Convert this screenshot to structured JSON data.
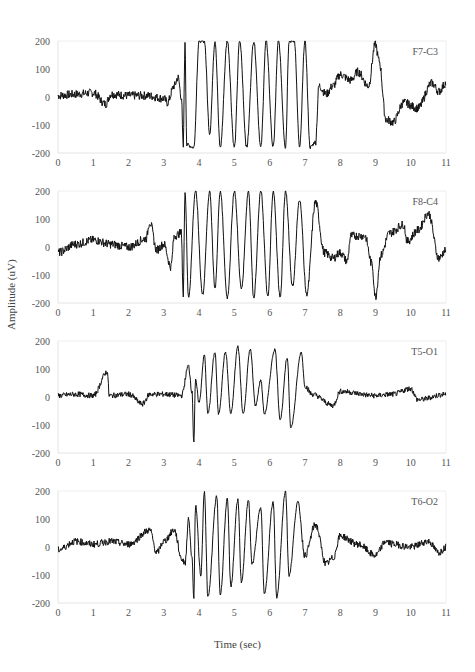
{
  "chart_data": {
    "type": "line",
    "title": "",
    "xlabel": "Time (sec)",
    "ylabel": "Amplitude (uV)",
    "xlim": [
      0,
      11
    ],
    "ylim": [
      -200,
      200
    ],
    "x_ticks": [
      "0",
      "1",
      "2",
      "3",
      "4",
      "5",
      "6",
      "7",
      "8",
      "9",
      "10",
      "11"
    ],
    "y_ticks": [
      "200",
      "100",
      "0",
      "-100",
      "-200"
    ],
    "grid": false,
    "line_color": "#111111",
    "panels": [
      {
        "channel": "F7-C3",
        "keypoints": [
          [
            0,
            5
          ],
          [
            0.5,
            10
          ],
          [
            1.0,
            15
          ],
          [
            1.35,
            -25
          ],
          [
            1.5,
            10
          ],
          [
            2.0,
            5
          ],
          [
            2.5,
            5
          ],
          [
            3.0,
            -5
          ],
          [
            3.1,
            -20
          ],
          [
            3.3,
            40
          ],
          [
            3.4,
            70
          ],
          [
            3.5,
            0
          ],
          [
            3.55,
            -180
          ],
          [
            3.6,
            190
          ],
          [
            3.65,
            -170
          ],
          [
            3.85,
            -180
          ],
          [
            4.0,
            200
          ],
          [
            4.15,
            200
          ],
          [
            4.3,
            -130
          ],
          [
            4.45,
            200
          ],
          [
            4.6,
            -180
          ],
          [
            4.8,
            200
          ],
          [
            5.0,
            -180
          ],
          [
            5.15,
            200
          ],
          [
            5.35,
            -180
          ],
          [
            5.55,
            200
          ],
          [
            5.75,
            -180
          ],
          [
            5.9,
            200
          ],
          [
            6.1,
            -180
          ],
          [
            6.25,
            200
          ],
          [
            6.45,
            -180
          ],
          [
            6.55,
            200
          ],
          [
            6.7,
            200
          ],
          [
            6.85,
            -180
          ],
          [
            7.0,
            200
          ],
          [
            7.15,
            -180
          ],
          [
            7.3,
            -160
          ],
          [
            7.4,
            40
          ],
          [
            7.6,
            10
          ],
          [
            7.8,
            40
          ],
          [
            8.0,
            80
          ],
          [
            8.3,
            60
          ],
          [
            8.5,
            90
          ],
          [
            8.8,
            40
          ],
          [
            9.0,
            190
          ],
          [
            9.1,
            130
          ],
          [
            9.3,
            -80
          ],
          [
            9.5,
            -90
          ],
          [
            9.8,
            -20
          ],
          [
            10.2,
            -40
          ],
          [
            10.6,
            50
          ],
          [
            10.8,
            20
          ],
          [
            11.0,
            50
          ]
        ],
        "burst": [
          3.55,
          7.3
        ],
        "noise": 22
      },
      {
        "channel": "F8-C4",
        "keypoints": [
          [
            0,
            -20
          ],
          [
            0.5,
            10
          ],
          [
            1.0,
            25
          ],
          [
            1.5,
            10
          ],
          [
            2.0,
            0
          ],
          [
            2.5,
            30
          ],
          [
            2.6,
            90
          ],
          [
            2.8,
            -10
          ],
          [
            3.0,
            10
          ],
          [
            3.2,
            -70
          ],
          [
            3.3,
            40
          ],
          [
            3.5,
            50
          ],
          [
            3.55,
            -180
          ],
          [
            3.6,
            200
          ],
          [
            3.7,
            -180
          ],
          [
            3.9,
            200
          ],
          [
            4.1,
            -170
          ],
          [
            4.3,
            200
          ],
          [
            4.45,
            -150
          ],
          [
            4.6,
            200
          ],
          [
            4.8,
            -180
          ],
          [
            5.0,
            200
          ],
          [
            5.2,
            -150
          ],
          [
            5.4,
            200
          ],
          [
            5.55,
            -180
          ],
          [
            5.75,
            200
          ],
          [
            5.95,
            -180
          ],
          [
            6.1,
            200
          ],
          [
            6.3,
            -180
          ],
          [
            6.45,
            200
          ],
          [
            6.65,
            -140
          ],
          [
            6.85,
            170
          ],
          [
            7.05,
            -170
          ],
          [
            7.3,
            160
          ],
          [
            7.55,
            -20
          ],
          [
            7.8,
            -40
          ],
          [
            8.0,
            -20
          ],
          [
            8.2,
            -50
          ],
          [
            8.3,
            40
          ],
          [
            8.7,
            40
          ],
          [
            8.9,
            -60
          ],
          [
            9.0,
            -180
          ],
          [
            9.15,
            -30
          ],
          [
            9.4,
            50
          ],
          [
            9.8,
            80
          ],
          [
            9.9,
            20
          ],
          [
            10.2,
            60
          ],
          [
            10.5,
            120
          ],
          [
            10.8,
            -40
          ],
          [
            11.0,
            -10
          ]
        ],
        "burst": [
          3.55,
          7.1
        ],
        "noise": 22
      },
      {
        "channel": "T5-O1",
        "keypoints": [
          [
            0,
            5
          ],
          [
            0.5,
            10
          ],
          [
            1.0,
            5
          ],
          [
            1.4,
            90
          ],
          [
            1.45,
            5
          ],
          [
            2.0,
            10
          ],
          [
            2.4,
            -25
          ],
          [
            2.6,
            10
          ],
          [
            3.0,
            10
          ],
          [
            3.5,
            5
          ],
          [
            3.7,
            110
          ],
          [
            3.8,
            20
          ],
          [
            3.85,
            -160
          ],
          [
            3.9,
            60
          ],
          [
            4.0,
            -20
          ],
          [
            4.15,
            150
          ],
          [
            4.25,
            -60
          ],
          [
            4.45,
            160
          ],
          [
            4.55,
            -60
          ],
          [
            4.75,
            160
          ],
          [
            4.9,
            -60
          ],
          [
            5.1,
            180
          ],
          [
            5.25,
            -60
          ],
          [
            5.45,
            170
          ],
          [
            5.6,
            -30
          ],
          [
            5.75,
            60
          ],
          [
            5.85,
            -60
          ],
          [
            6.15,
            170
          ],
          [
            6.3,
            -80
          ],
          [
            6.5,
            140
          ],
          [
            6.6,
            -110
          ],
          [
            6.9,
            160
          ],
          [
            7.0,
            40
          ],
          [
            7.2,
            10
          ],
          [
            7.8,
            -30
          ],
          [
            8.0,
            20
          ],
          [
            9.0,
            5
          ],
          [
            9.5,
            10
          ],
          [
            10.0,
            30
          ],
          [
            10.2,
            -10
          ],
          [
            11.0,
            10
          ]
        ],
        "burst": [
          3.8,
          7.0
        ],
        "noise": 14
      },
      {
        "channel": "T6-O2",
        "keypoints": [
          [
            0,
            -10
          ],
          [
            0.5,
            20
          ],
          [
            1.0,
            10
          ],
          [
            1.5,
            20
          ],
          [
            2.0,
            10
          ],
          [
            2.6,
            60
          ],
          [
            2.8,
            -20
          ],
          [
            3.0,
            20
          ],
          [
            3.3,
            60
          ],
          [
            3.5,
            -40
          ],
          [
            3.6,
            -60
          ],
          [
            3.7,
            100
          ],
          [
            3.8,
            -40
          ],
          [
            3.85,
            -180
          ],
          [
            3.9,
            150
          ],
          [
            4.05,
            -100
          ],
          [
            4.15,
            200
          ],
          [
            4.25,
            -180
          ],
          [
            4.5,
            180
          ],
          [
            4.6,
            -170
          ],
          [
            4.8,
            170
          ],
          [
            4.9,
            -140
          ],
          [
            5.1,
            170
          ],
          [
            5.2,
            -130
          ],
          [
            5.4,
            170
          ],
          [
            5.5,
            -60
          ],
          [
            5.75,
            140
          ],
          [
            5.85,
            -170
          ],
          [
            6.1,
            160
          ],
          [
            6.2,
            -180
          ],
          [
            6.45,
            200
          ],
          [
            6.55,
            -100
          ],
          [
            6.8,
            160
          ],
          [
            7.0,
            -30
          ],
          [
            7.3,
            80
          ],
          [
            7.6,
            -60
          ],
          [
            7.8,
            -40
          ],
          [
            8.0,
            40
          ],
          [
            8.5,
            10
          ],
          [
            9.0,
            -30
          ],
          [
            9.3,
            20
          ],
          [
            9.5,
            10
          ],
          [
            10.0,
            0
          ],
          [
            10.5,
            20
          ],
          [
            10.8,
            -20
          ],
          [
            11.0,
            0
          ]
        ],
        "burst": [
          3.7,
          6.9
        ],
        "noise": 18
      }
    ]
  }
}
